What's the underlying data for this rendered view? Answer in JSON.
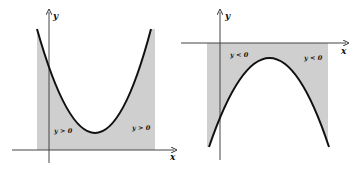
{
  "figure": {
    "left_graph": {
      "curve": "upward parabola",
      "axis_x_label": "x",
      "axis_y_label": "y",
      "region_label_left": "y > 0",
      "region_label_right": "y > 0",
      "shade_color": "#cfcfcf",
      "curve_color": "#111111"
    },
    "right_graph": {
      "curve": "downward parabola",
      "axis_x_label": "x",
      "axis_y_label": "y",
      "region_label_left": "y < 0",
      "region_label_right": "y < 0",
      "shade_color": "#cfcfcf",
      "curve_color": "#111111"
    }
  }
}
